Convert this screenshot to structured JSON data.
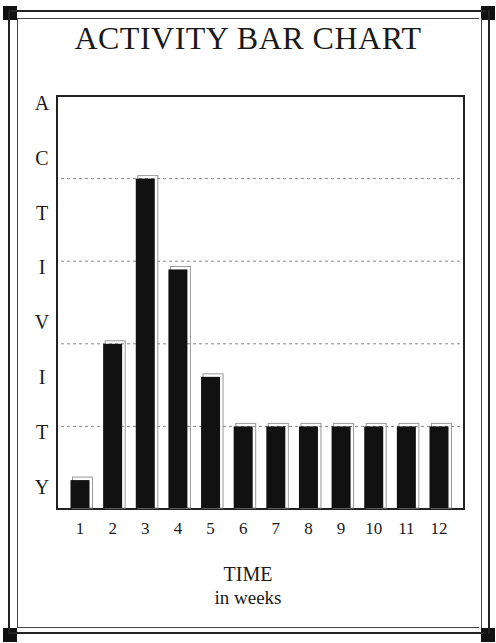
{
  "chart_data": {
    "type": "bar",
    "title": "ACTIVITY BAR CHART",
    "xlabel": "TIME",
    "xlabel_sub": "in weeks",
    "ylabel": "ACTIVITY",
    "ylabel_letters": [
      "A",
      "C",
      "T",
      "I",
      "V",
      "I",
      "T",
      "Y"
    ],
    "categories": [
      "1",
      "2",
      "3",
      "4",
      "5",
      "6",
      "7",
      "8",
      "9",
      "10",
      "11",
      "12"
    ],
    "values": [
      7,
      40,
      80,
      58,
      32,
      20,
      20,
      20,
      20,
      20,
      20,
      20
    ],
    "ylim": [
      0,
      100
    ],
    "gridlines": [
      20,
      40,
      60,
      80
    ],
    "grid": "dashed horizontal",
    "legend": "none",
    "colors": {
      "bar": "#111111",
      "bar_shadow": "#999999",
      "grid": "#888888",
      "frame": "#222222"
    }
  }
}
